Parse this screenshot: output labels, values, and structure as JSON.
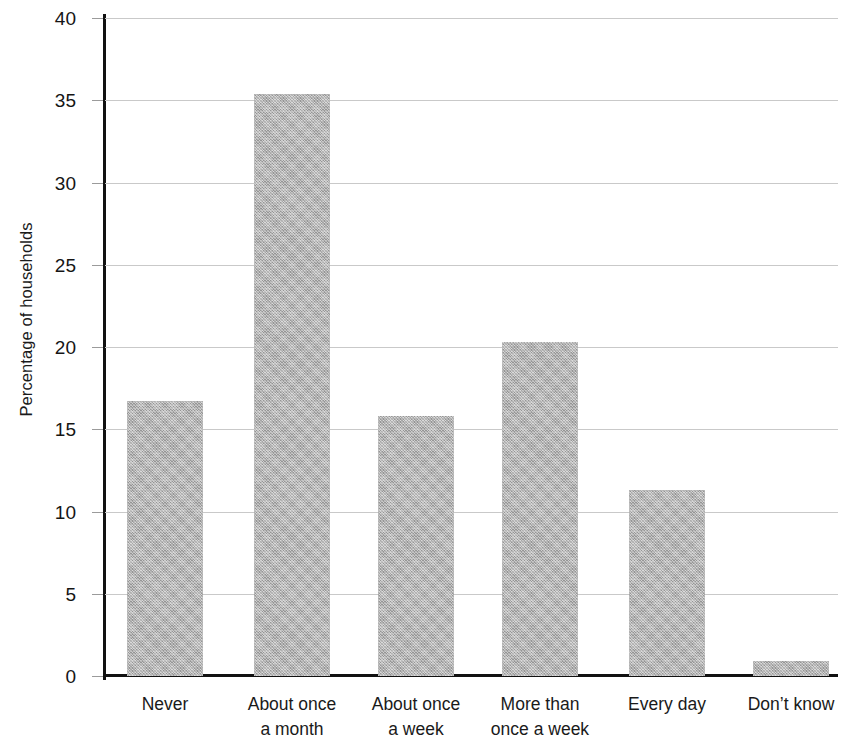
{
  "chart_data": {
    "type": "bar",
    "title": "",
    "xlabel": "",
    "ylabel": "Percentage of households",
    "categories": [
      "Never",
      "About once\na month",
      "About once\na week",
      "More than\nonce a week",
      "Every day",
      "Don’t know"
    ],
    "category_lines": [
      [
        "Never"
      ],
      [
        "About once",
        "a month"
      ],
      [
        "About once",
        "a week"
      ],
      [
        "More than",
        "once a week"
      ],
      [
        "Every day"
      ],
      [
        "Don’t know"
      ]
    ],
    "values": [
      16.7,
      35.4,
      15.8,
      20.3,
      11.3,
      0.9
    ],
    "ylim": [
      0,
      40
    ],
    "ytick_values": [
      0,
      5,
      10,
      15,
      20,
      25,
      30,
      35,
      40
    ],
    "ytick_labels": [
      "0",
      "5",
      "10",
      "15",
      "20",
      "25",
      "30",
      "35",
      "40"
    ],
    "grid": true,
    "grid_axis": "y",
    "legend": false,
    "bar_color": "#b3b3b3",
    "axis_color": "#111111",
    "grid_color": "#c9c9c9"
  }
}
